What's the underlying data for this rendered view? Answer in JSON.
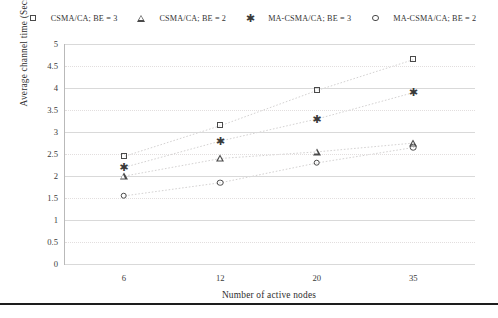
{
  "chart_data": {
    "type": "scatter",
    "title": "",
    "xlabel": "Number of active nodes",
    "ylabel": "Average channel time (Secs)",
    "categories": [
      "6",
      "12",
      "20",
      "35"
    ],
    "x": [
      6,
      12,
      20,
      35
    ],
    "ylim": [
      0,
      5
    ],
    "ytick_labels": [
      "0",
      "0.5",
      "1",
      "1.5",
      "2",
      "2.5",
      "3",
      "3.5",
      "4",
      "4.5",
      "5"
    ],
    "ytick_values": [
      0,
      0.5,
      1,
      1.5,
      2,
      2.5,
      3,
      3.5,
      4,
      4.5,
      5
    ],
    "grid": true,
    "legend_position": "top",
    "series": [
      {
        "name": "CSMA/CA; BE = 3",
        "marker": "square",
        "values": [
          2.45,
          3.15,
          3.95,
          4.65
        ]
      },
      {
        "name": "CSMA/CA; BE = 2",
        "marker": "triangle",
        "values": [
          2.0,
          2.4,
          2.55,
          2.75
        ]
      },
      {
        "name": "MA-CSMA/CA; BE = 3",
        "marker": "asterisk",
        "values": [
          2.2,
          2.8,
          3.3,
          3.9
        ]
      },
      {
        "name": "MA-CSMA/CA; BE = 2",
        "marker": "circle",
        "values": [
          1.55,
          1.85,
          2.3,
          2.65
        ]
      }
    ]
  },
  "legend": {
    "items": [
      {
        "label": "CSMA/CA; BE = 3",
        "marker": "square-marker-icon"
      },
      {
        "label": "CSMA/CA; BE = 2",
        "marker": "triangle-marker-icon"
      },
      {
        "label": "MA-CSMA/CA; BE = 3",
        "marker": "asterisk-marker-icon"
      },
      {
        "label": "MA-CSMA/CA; BE = 2",
        "marker": "circle-marker-icon"
      }
    ]
  },
  "axes": {
    "y_title": "Average channel time (Secs)",
    "x_title": "Number of active nodes"
  },
  "colors": {
    "marker": "#4a4a4a",
    "grid": "#d9d9d9",
    "axis": "#b9b9b9",
    "text": "#2e2e2e",
    "rule": "#1d1d1d"
  }
}
